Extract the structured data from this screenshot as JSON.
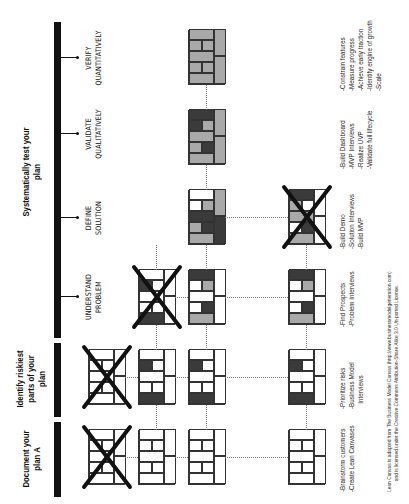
{
  "phases": [
    {
      "id": "document",
      "title": "Document your plan A"
    },
    {
      "id": "identify",
      "title": "Identify riskiest parts of your plan"
    },
    {
      "id": "test",
      "title": "Systematically test your plan"
    }
  ],
  "stages": [
    {
      "line1": "UNDERSTAND",
      "line2": "PROBLEM"
    },
    {
      "line1": "DEFINE",
      "line2": "SOLUTION"
    },
    {
      "line1": "VALIDATE",
      "line2": "QUALITATIVELY"
    },
    {
      "line1": "VERIFY",
      "line2": "QUANTITATIVELY"
    }
  ],
  "tasks": [
    "-Brainstorm customers\n-Create Lean Canvases",
    "-Prioritize risks\n-Business Model\n   Interviews",
    "-Find Prospects\n-Problem Interviews",
    "-Build Demo\n-Solution Interviews\n-Build MVP",
    "-Build Dashboard\n-MVP Interviews\n-Realize UVP\n-Validate full lifecycle",
    "-Constrain features\n-Measure progress\n-Achieve early traction\n-Identify engine of growth\n-Scale"
  ],
  "footer": {
    "line1": "Lean Canvas is adapted from The Business Model Canvas (http://www.businessmodelgeneration.com)",
    "line2": "and is licensed under the Creative Commons Attribution-Share Alike 3.0 Un-ported License."
  },
  "colors": {
    "dark": "#3a3a3a",
    "light": "#a9a9a9",
    "bar": "#111111"
  }
}
